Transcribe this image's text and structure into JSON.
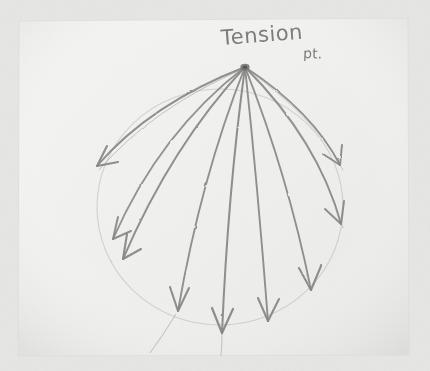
{
  "image": {
    "kind": "photograph-of-pencil-sketch",
    "width": 430,
    "height": 371,
    "background_color": "#eaeae9",
    "paper_color": "#f2f2f1"
  },
  "paper": {
    "name": "sketch-paper-sheet",
    "left": 18,
    "top": 20,
    "right": 409,
    "bottom": 356,
    "corner_tilt_degrees": -0.6
  },
  "annotations": {
    "title_text": "Tension",
    "title_suffix": "pt.",
    "full_label": "Tension pt.",
    "ink_color": "#6d6d6d",
    "graphite_color": "#8a8a8a"
  },
  "drawing": {
    "apex": {
      "name": "tension-point",
      "x": 245,
      "y": 67
    },
    "circle": {
      "name": "reference-circle",
      "cx": 220,
      "cy": 207,
      "rx": 123,
      "ry": 118,
      "stroke_color": "#c2c2c0",
      "stroke_width": 1.1
    },
    "arrows": [
      {
        "id": "arrow-1",
        "label": "far-left",
        "tip_x": 95,
        "tip_y": 168,
        "ctrl_x": 150,
        "ctrl_y": 104,
        "head_angle_deg": 208
      },
      {
        "id": "arrow-2",
        "label": "left-upper",
        "tip_x": 112,
        "tip_y": 238,
        "ctrl_x": 160,
        "ctrl_y": 132,
        "head_angle_deg": 215
      },
      {
        "id": "arrow-3",
        "label": "left-lower",
        "tip_x": 122,
        "tip_y": 258,
        "ctrl_x": 172,
        "ctrl_y": 145,
        "head_angle_deg": 218
      },
      {
        "id": "arrow-4",
        "label": "lower-left",
        "tip_x": 178,
        "tip_y": 312,
        "ctrl_x": 201,
        "ctrl_y": 178,
        "head_angle_deg": 253
      },
      {
        "id": "arrow-5",
        "label": "bottom-left-center",
        "tip_x": 222,
        "tip_y": 333,
        "ctrl_x": 228,
        "ctrl_y": 192,
        "head_angle_deg": 268
      },
      {
        "id": "arrow-6",
        "label": "bottom-right-center",
        "tip_x": 268,
        "tip_y": 322,
        "ctrl_x": 258,
        "ctrl_y": 190,
        "head_angle_deg": 283
      },
      {
        "id": "arrow-7",
        "label": "lower-right",
        "tip_x": 311,
        "tip_y": 291,
        "ctrl_x": 288,
        "ctrl_y": 176,
        "head_angle_deg": 297
      },
      {
        "id": "arrow-8",
        "label": "right-lower",
        "tip_x": 341,
        "tip_y": 224,
        "ctrl_x": 318,
        "ctrl_y": 140,
        "head_angle_deg": 318
      },
      {
        "id": "arrow-9",
        "label": "right-upper",
        "tip_x": 340,
        "tip_y": 166,
        "ctrl_x": 313,
        "ctrl_y": 112,
        "head_angle_deg": 330
      }
    ],
    "tail_lines": [
      {
        "id": "tail-left",
        "x1": 176,
        "y1": 315,
        "x2": 150,
        "y2": 352
      },
      {
        "id": "tail-center",
        "x1": 222,
        "y1": 334,
        "x2": 222,
        "y2": 356
      }
    ]
  }
}
